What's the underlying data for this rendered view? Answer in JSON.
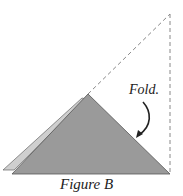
{
  "figure": {
    "caption": "Figure B",
    "annotation": "Fold.",
    "colors": {
      "main_triangle": "#9a9a9a",
      "back_flap": "#c8c8c8",
      "outline": "#555555",
      "dashed_line": "#888888",
      "arrow": "#222222"
    }
  }
}
